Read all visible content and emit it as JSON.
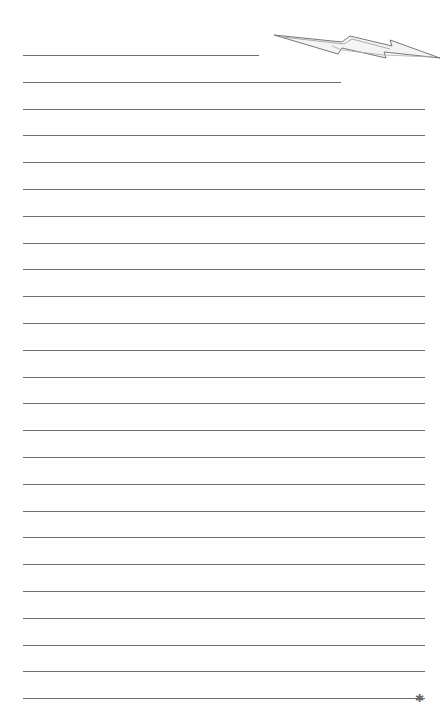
{
  "page": {
    "type": "lined-notepaper",
    "line_count": 25,
    "first_line_y": 55,
    "line_spacing": 26.8,
    "line_color": "#6e6e6e",
    "short_lines": [
      {
        "index": 0,
        "width": 236
      },
      {
        "index": 1,
        "width": 318
      }
    ],
    "full_width": 402
  },
  "decorations": {
    "top_right": "lightning-bolt-icon",
    "bottom_right": "star-icon",
    "star_glyph": "✱"
  }
}
